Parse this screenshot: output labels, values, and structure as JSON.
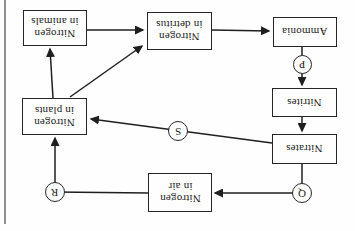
{
  "diagram": {
    "nodes": {
      "animals": {
        "label": "Nitrogen\nin animals"
      },
      "detritus": {
        "label": "Nitrogen\nin detritus"
      },
      "ammonia": {
        "label": "Ammonia"
      },
      "nitrites": {
        "label": "Nitrites"
      },
      "nitrates": {
        "label": "Nitrates"
      },
      "plants": {
        "label": "Nitrogen\nin plants"
      },
      "air": {
        "label": "Nitrogen\nin air"
      }
    },
    "connectors": {
      "p": {
        "label": "P"
      },
      "q": {
        "label": "Q"
      },
      "r": {
        "label": "R"
      },
      "s": {
        "label": "S"
      }
    },
    "edges": [
      {
        "from": "Nitrogen in animals",
        "to": "Nitrogen in detritus"
      },
      {
        "from": "Nitrogen in plants",
        "to": "Nitrogen in detritus"
      },
      {
        "from": "Nitrogen in detritus",
        "to": "Ammonia"
      },
      {
        "from": "Ammonia",
        "to": "Nitrites",
        "via": "P"
      },
      {
        "from": "Nitrites",
        "to": "Nitrates"
      },
      {
        "from": "Nitrates",
        "to": "Nitrogen in air",
        "via": "Q"
      },
      {
        "from": "Nitrates",
        "to": "Nitrogen in plants",
        "via": "S"
      },
      {
        "from": "Nitrogen in air",
        "to": "Nitrogen in plants",
        "via": "R"
      },
      {
        "from": "Nitrogen in plants",
        "to": "Nitrogen in animals"
      }
    ],
    "colors": {
      "line": "#1f1f1f",
      "box_border": "#262626",
      "page_rule_gray": "#8f8f8f",
      "background": "#fefefe"
    }
  }
}
